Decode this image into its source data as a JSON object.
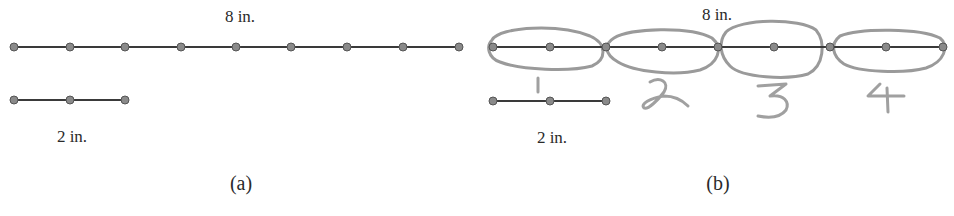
{
  "panels": [
    {
      "id": "a",
      "caption": "(a)",
      "long_segment": {
        "label": "8 in.",
        "points": 9
      },
      "short_segment": {
        "label": "2 in.",
        "points": 3
      }
    },
    {
      "id": "b",
      "caption": "(b)",
      "long_segment": {
        "label": "8 in.",
        "points": 9
      },
      "short_segment": {
        "label": "2 in.",
        "points": 3
      },
      "groups": [
        {
          "number": "1"
        },
        {
          "number": "2"
        },
        {
          "number": "3"
        },
        {
          "number": "4"
        }
      ]
    }
  ]
}
